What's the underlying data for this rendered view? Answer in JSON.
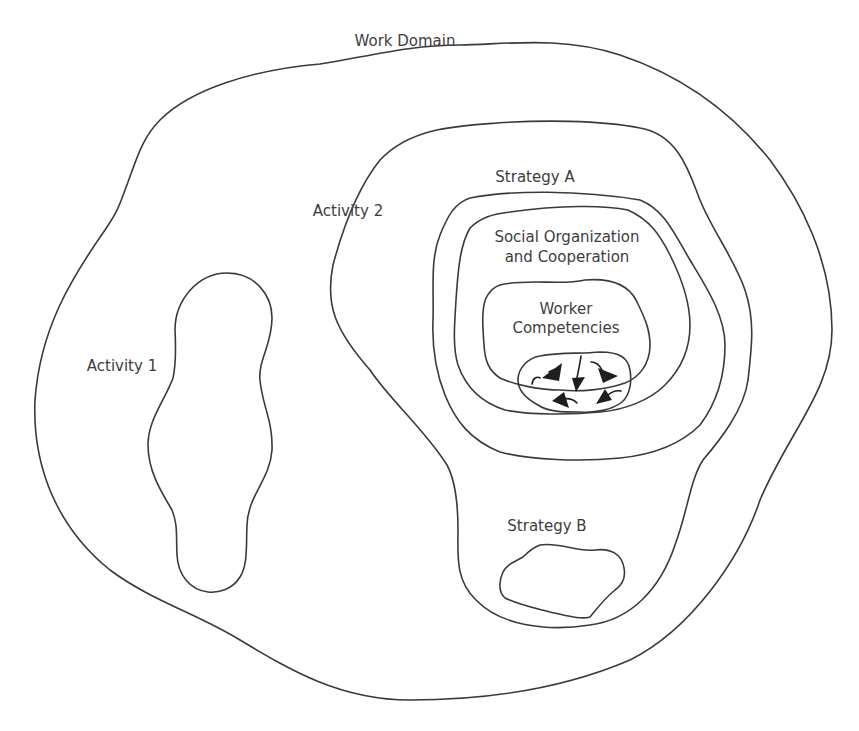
{
  "diagram": {
    "outer": {
      "label": "Work Domain"
    },
    "activity1": {
      "label": "Activity 1"
    },
    "activity2": {
      "label": "Activity 2"
    },
    "strategy_a": {
      "label": "Strategy A"
    },
    "social": {
      "line1": "Social Organization",
      "line2": "and Cooperation"
    },
    "competencies": {
      "line1": "Worker",
      "line2": "Competencies"
    },
    "strategy_b": {
      "label": "Strategy B"
    },
    "core": {
      "icon": "swirling-arrows-icon",
      "arrow_count": 5
    }
  },
  "colors": {
    "stroke": "#3a3a3a",
    "text": "#3d3d3d",
    "arrow": "#1e1e1e",
    "background": "#ffffff"
  }
}
